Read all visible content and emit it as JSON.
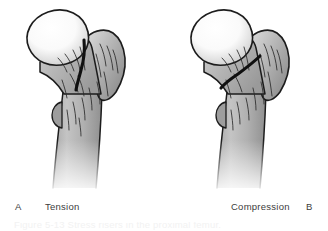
{
  "figure": {
    "type": "medical-illustration",
    "background_color": "#ffffff",
    "label_color": "#3c3c3c",
    "panels": [
      {
        "id": "A",
        "letter": "A",
        "label": "Tension",
        "side": "left",
        "bone": "proximal femur",
        "fracture_orientation": "oblique, femoral neck, superior-lateral",
        "outline_color": "#1a1a1a",
        "bone_fill_light": "#f4f4f4",
        "bone_fill_mid": "#bcbcbc",
        "bone_fill_dark": "#8f8f8f",
        "head_fill_light": "#fdfdfd",
        "head_fill_dark": "#d0d0d0",
        "parts": [
          "femoral head",
          "femoral neck",
          "greater trochanter",
          "lesser trochanter",
          "femoral shaft",
          "fracture line"
        ]
      },
      {
        "id": "B",
        "letter": "B",
        "label": "Compression",
        "side": "right",
        "bone": "proximal femur",
        "fracture_orientation": "transverse, femoral neck, inferior-medial",
        "outline_color": "#1a1a1a",
        "bone_fill_light": "#f4f4f4",
        "bone_fill_mid": "#bcbcbc",
        "bone_fill_dark": "#8f8f8f",
        "head_fill_light": "#fdfdfd",
        "head_fill_dark": "#d0d0d0",
        "parts": [
          "femoral head",
          "femoral neck",
          "greater trochanter",
          "lesser trochanter",
          "femoral shaft",
          "fracture line"
        ]
      }
    ],
    "cropped_caption_fragment": "Figure  5-13  Stress  risers  in  the  proximal  femur."
  }
}
